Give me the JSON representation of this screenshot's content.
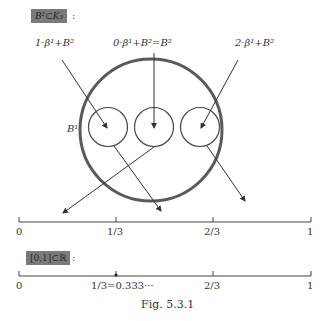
{
  "top_section": {
    "set_tag": "B²⊂K₃",
    "colon": ":",
    "labels": {
      "left": "1·β¹+B²",
      "center": "0·β¹+B²=B²",
      "right": "2·β¹+B²",
      "big_circle": "B¹"
    },
    "number_line": {
      "ticks": [
        "0",
        "1/3",
        "2/3",
        "1"
      ]
    }
  },
  "bottom_section": {
    "set_tag": "[0,1]⊂ℝ",
    "colon": ":",
    "number_line": {
      "ticks": [
        "0",
        "1/3=0.333···",
        "2/3",
        "1"
      ]
    }
  },
  "caption": "Fig. 5.3.1",
  "colors": {
    "tag_background": "#7a7a7a",
    "stroke": "#444444",
    "big_circle_stroke": "#555555"
  }
}
